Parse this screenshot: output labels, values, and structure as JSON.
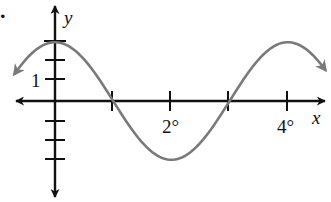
{
  "chart_data": {
    "type": "line",
    "title": "",
    "xlabel": "x",
    "ylabel": "y",
    "function": "y = 3 cos(90x°)",
    "x_tick_labels": [
      {
        "value": 2,
        "label": "2°"
      },
      {
        "value": 4,
        "label": "4°"
      }
    ],
    "x_ticks": [
      1,
      2,
      3,
      4
    ],
    "y_tick_labels": [
      {
        "value": 1,
        "label": "1"
      }
    ],
    "y_ticks": [
      -3,
      -2,
      -1,
      1,
      2,
      3
    ],
    "xlim": [
      -0.7,
      4.7
    ],
    "ylim": [
      -4.9,
      4.9
    ],
    "grid": false,
    "legend": null,
    "series": [
      {
        "name": "curve",
        "color": "#7a7a7a",
        "x": [
          -0.7,
          -0.5,
          0,
          0.5,
          1,
          1.5,
          2,
          2.5,
          3,
          3.5,
          4,
          4.5,
          4.65
        ],
        "values": [
          1.36,
          2.12,
          3,
          2.12,
          0,
          -2.12,
          -3,
          -2.12,
          0,
          2.12,
          3,
          2.12,
          1.62
        ]
      }
    ],
    "annotations": [
      {
        "text": ".",
        "position": "top-left"
      }
    ]
  },
  "labels": {
    "x_axis": "x",
    "y_axis": "y",
    "tick_2": "2°",
    "tick_4": "4°",
    "tick_1": "1",
    "marker": "."
  },
  "colors": {
    "axis": "#111111",
    "curve": "#7a7a7a"
  }
}
